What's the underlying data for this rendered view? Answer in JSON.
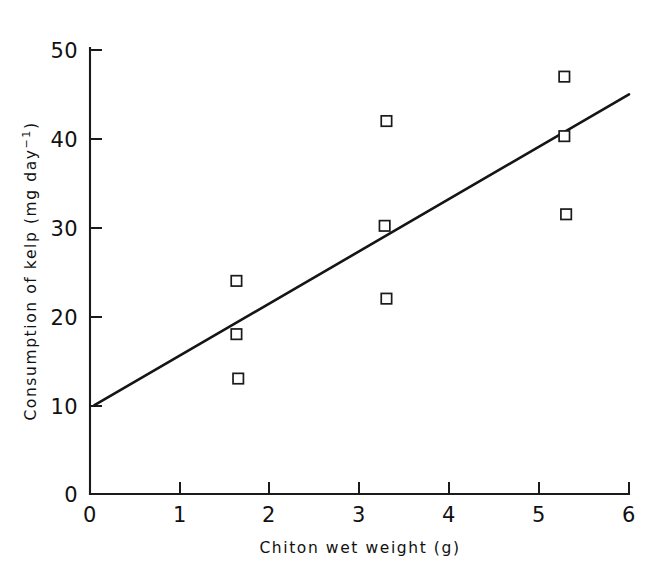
{
  "chart_data": {
    "type": "scatter",
    "title": "",
    "subtitle": "",
    "xlabel": "Chiton wet weight (g)",
    "ylabel": "Consumption of kelp (mg day−1)",
    "ylabel_parts": {
      "main": "Consumption of kelp (mg day",
      "superscript": "−1",
      "tail": ")"
    },
    "xlim": [
      0,
      6
    ],
    "ylim": [
      0,
      50
    ],
    "xticks": [
      0,
      1,
      2,
      3,
      4,
      5,
      6
    ],
    "xtick_labels": [
      "0",
      "1",
      "2",
      "3",
      "4",
      "5",
      "6"
    ],
    "yticks": [
      0,
      10,
      20,
      30,
      40,
      50
    ],
    "ytick_labels": [
      "0",
      "10",
      "20",
      "30",
      "40",
      "50"
    ],
    "grid": false,
    "legend": null,
    "marker_style": "open-square",
    "series": [
      {
        "name": "Chiton kelp consumption",
        "marker": "open-square",
        "points": [
          {
            "x": 1.63,
            "y": 24.0
          },
          {
            "x": 1.63,
            "y": 18.0
          },
          {
            "x": 1.65,
            "y": 13.0
          },
          {
            "x": 3.3,
            "y": 42.0
          },
          {
            "x": 3.28,
            "y": 30.2
          },
          {
            "x": 3.3,
            "y": 22.0
          },
          {
            "x": 5.28,
            "y": 47.0
          },
          {
            "x": 5.28,
            "y": 40.3
          },
          {
            "x": 5.3,
            "y": 31.5
          }
        ]
      }
    ],
    "fit_line": {
      "name": "regression line",
      "type": "linear",
      "x_start": 0.05,
      "y_start": 10.0,
      "x_end": 6.0,
      "y_end": 45.0,
      "slope": 5.88,
      "intercept": 9.7
    },
    "colors": {
      "axis": "#1a1a1a",
      "marker_edge": "#1a1a1a",
      "marker_face": "#ffffff",
      "fit_line": "#151515",
      "background": "#ffffff"
    }
  }
}
